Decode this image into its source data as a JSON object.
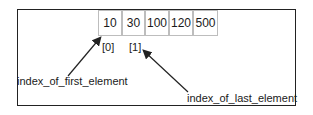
{
  "array": {
    "values": [
      "10",
      "30",
      "100",
      "120",
      "500"
    ]
  },
  "indices": [
    "[0]",
    "[1]"
  ],
  "labels": {
    "first": "index_of_first_element",
    "last": "index_of_last_element"
  }
}
